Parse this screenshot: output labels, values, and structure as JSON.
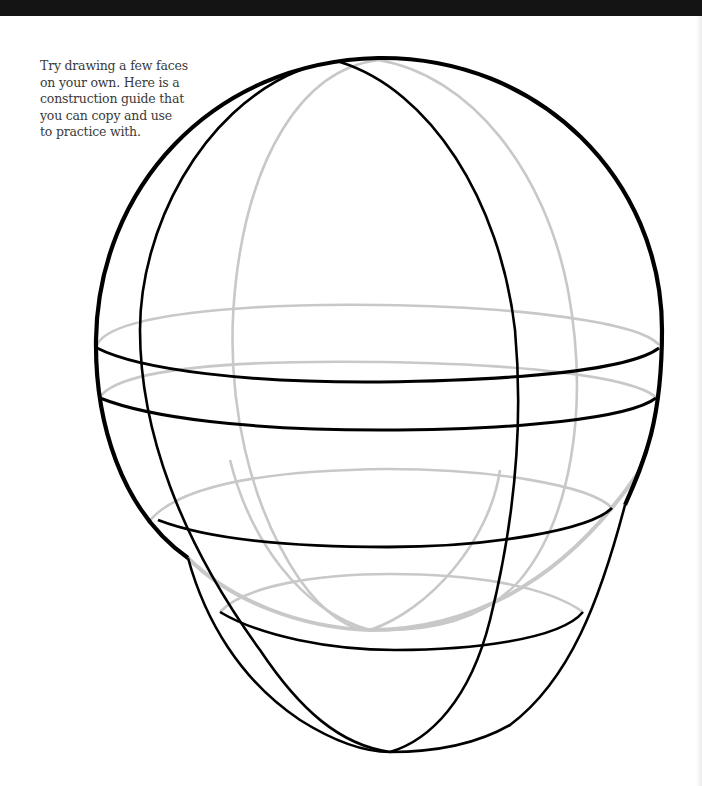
{
  "page": {
    "caption_lines": [
      "Try drawing a few faces",
      "on your own. Here is a",
      "construction guide that",
      "you can copy and use",
      "to practice with."
    ]
  },
  "illustration": {
    "subject": "head construction guide",
    "colors": {
      "front_lines": "#000000",
      "back_lines": "#c8c8c8",
      "background": "#ffffff",
      "top_band": "#141414"
    }
  }
}
